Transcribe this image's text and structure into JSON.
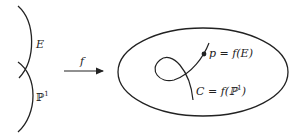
{
  "diagram": {
    "left": {
      "upper_curve_label": "E",
      "lower_curve_label": "ℙ",
      "lower_curve_superscript": "1"
    },
    "map": {
      "label": "f"
    },
    "right": {
      "point_label": "p = f(E)",
      "curve_label": "C = f(ℙ",
      "curve_label_superscript": "1",
      "curve_label_close": ")"
    },
    "colors": {
      "stroke": "#222222",
      "background": "#ffffff"
    }
  }
}
